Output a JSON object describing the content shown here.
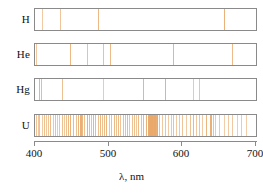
{
  "figure": {
    "axis": {
      "xlabel": "λ, nm",
      "ticks": [
        "400",
        "500",
        "600",
        "700"
      ],
      "xmin": 400,
      "xmax": 700
    },
    "line_color": "#e8a96a",
    "frame_color": "#8a8a8a",
    "background": "#ffffff"
  },
  "chart_data": {
    "type": "line",
    "title": "",
    "subtitle": "",
    "xlabel": "λ, nm",
    "ylabel": "",
    "xlim": [
      400,
      700
    ],
    "xticks": [
      400,
      500,
      600,
      700
    ],
    "grid": false,
    "legend": "none",
    "series": [
      {
        "name": "H",
        "label": "H",
        "lines_nm": [
          410,
          434,
          486,
          656
        ],
        "intensities": [
          0.45,
          0.55,
          0.75,
          0.85
        ]
      },
      {
        "name": "He",
        "label": "He",
        "lines_nm": [
          402,
          447,
          471,
          492,
          502,
          588,
          668
        ],
        "intensities": [
          0.5,
          0.75,
          0.6,
          0.6,
          0.7,
          0.8,
          0.7
        ]
      },
      {
        "name": "Hg",
        "label": "Hg",
        "lines_nm": [
          405,
          408,
          436,
          492,
          546,
          577,
          615,
          623
        ],
        "intensities": [
          0.8,
          0.7,
          0.6,
          0.45,
          0.8,
          0.85,
          0.5,
          0.55
        ]
      },
      {
        "name": "U",
        "label": "U",
        "lines_nm": [
          401,
          404,
          406,
          409,
          412,
          415,
          418,
          421,
          424,
          427,
          430,
          433,
          436,
          439,
          442,
          445,
          448,
          452,
          455,
          458,
          461,
          464,
          467,
          470,
          473,
          476,
          479,
          482,
          485,
          488,
          491,
          494,
          497,
          500,
          503,
          507,
          510,
          513,
          516,
          519,
          522,
          525,
          528,
          531,
          534,
          537,
          540,
          544,
          547,
          550,
          553,
          556,
          558,
          560,
          562,
          564,
          566,
          569,
          572,
          576,
          580,
          584,
          588,
          592,
          596,
          600,
          605,
          610,
          614,
          618,
          622,
          627,
          632,
          637,
          641,
          645,
          650,
          656,
          662,
          668,
          674,
          680,
          686
        ],
        "intensities": [
          0.55,
          0.5,
          0.6,
          0.45,
          0.65,
          0.5,
          0.55,
          0.7,
          0.5,
          0.6,
          0.45,
          0.55,
          0.65,
          0.5,
          0.6,
          0.75,
          0.85,
          0.7,
          0.6,
          0.8,
          0.9,
          0.75,
          0.65,
          0.85,
          0.7,
          0.6,
          0.8,
          0.7,
          0.65,
          0.75,
          0.6,
          0.7,
          0.8,
          0.55,
          0.65,
          0.75,
          0.6,
          0.7,
          0.55,
          0.65,
          0.6,
          0.7,
          0.55,
          0.6,
          0.65,
          0.5,
          0.7,
          0.6,
          0.75,
          0.85,
          0.95,
          1.0,
          1.0,
          0.95,
          1.0,
          0.9,
          0.8,
          0.6,
          0.5,
          0.55,
          0.45,
          0.5,
          0.6,
          0.45,
          0.5,
          0.55,
          0.45,
          0.6,
          0.75,
          0.5,
          0.55,
          0.45,
          0.8,
          0.9,
          0.6,
          0.45,
          0.5,
          0.4,
          0.45,
          0.5,
          0.4,
          0.45,
          0.4
        ]
      }
    ]
  }
}
